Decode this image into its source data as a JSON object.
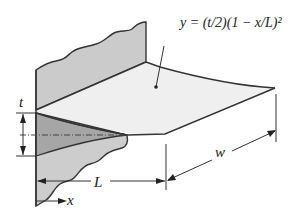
{
  "figure": {
    "equation": "y = (t/2)(1 − x/L)²",
    "labels": {
      "thickness": "t",
      "length": "L",
      "width": "w",
      "axis": "x"
    },
    "colors": {
      "line": "#333333",
      "wall_fill": "#c9c9c9",
      "wall_lower_fill": "#a9a9a9",
      "fin_fill": "#eeeeee"
    }
  }
}
